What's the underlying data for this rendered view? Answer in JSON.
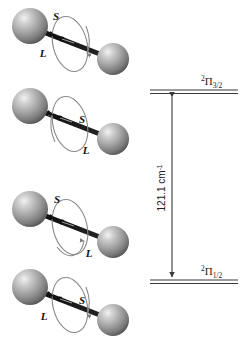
{
  "figure": {
    "background_color": "#ffffff",
    "molecules": [
      {
        "id": "molecule-1",
        "spin_label": "S",
        "orbital_label": "L",
        "spin_arrow_direction": "left",
        "orbital_circulation_direction": "clockwise",
        "spin_label_position": "above-center",
        "orbital_label_position": "below-left"
      },
      {
        "id": "molecule-2",
        "spin_label": "S",
        "orbital_label": "L",
        "spin_arrow_direction": "left",
        "orbital_circulation_direction": "counterclockwise",
        "spin_label_position": "right-of-arrow",
        "orbital_label_position": "below-right"
      },
      {
        "id": "molecule-3",
        "spin_label": "S",
        "orbital_label": "L",
        "spin_arrow_direction": "left",
        "orbital_circulation_direction": "counterclockwise",
        "spin_label_position": "above-center",
        "orbital_label_position": "below-right"
      },
      {
        "id": "molecule-4",
        "spin_label": "S",
        "orbital_label": "L",
        "spin_arrow_direction": "left",
        "orbital_circulation_direction": "clockwise",
        "spin_label_position": "right-of-arrow",
        "orbital_label_position": "below-left"
      }
    ],
    "atom_color_light": "#e8e8e8",
    "atom_color_mid": "#a9a9a9",
    "atom_color_dark": "#5a5a5a",
    "bond_color": "#111111",
    "orbit_color": "#8a8a8a"
  },
  "energy_diagram": {
    "upper_level": {
      "superscript": "2",
      "symbol": "Π",
      "subscript": "3/2"
    },
    "lower_level": {
      "superscript": "2",
      "symbol": "Π",
      "subscript": "1/2"
    },
    "splitting": {
      "value": "121.1",
      "unit": "cm",
      "unit_exponent": "-1",
      "full_text": "121.1 cm-1"
    },
    "line_color": "#3a3a3a",
    "arrow_color": "#3a3a3a"
  }
}
